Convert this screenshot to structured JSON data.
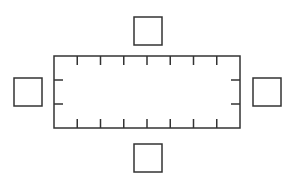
{
  "diagram": {
    "title": "",
    "stroke_color": "#333333",
    "background": "#ffffff",
    "table": {
      "x": 54,
      "y": 56,
      "width": 186,
      "height": 72,
      "top_ticks": 7,
      "bottom_ticks": 7,
      "left_ticks": 2,
      "right_ticks": 2,
      "tick_length": 9
    },
    "chairs": [
      {
        "id": "top",
        "x": 134,
        "y": 17,
        "size": 28
      },
      {
        "id": "bottom",
        "x": 134,
        "y": 144,
        "size": 28
      },
      {
        "id": "left",
        "x": 14,
        "y": 78,
        "size": 28
      },
      {
        "id": "right",
        "x": 253,
        "y": 78,
        "size": 28
      }
    ]
  }
}
